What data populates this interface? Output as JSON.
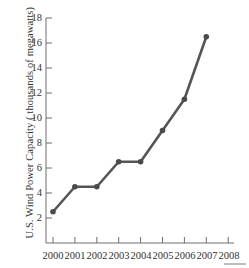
{
  "chart_data": {
    "type": "line",
    "title": "",
    "xlabel": "",
    "ylabel": "U.S. Wind Power Capacity ( thousands of megawatts)",
    "x": [
      2000,
      2001,
      2002,
      2003,
      2004,
      2005,
      2006,
      2007
    ],
    "values": [
      2.5,
      4.5,
      4.5,
      6.5,
      6.5,
      9.0,
      11.5,
      16.5
    ],
    "xtick_labels": [
      "2000",
      "2001",
      "2002",
      "2003",
      "2004",
      "2005",
      "2006",
      "2007",
      "2008"
    ],
    "ytick_labels": [
      "2",
      "4",
      "6",
      "8",
      "10",
      "12",
      "14",
      "16",
      "18"
    ],
    "xlim": [
      2000,
      2008
    ],
    "ylim": [
      0,
      18
    ],
    "grid": false,
    "legend": "none",
    "marker": "circle",
    "line_color": "#555555",
    "marker_color": "#4a4a4a",
    "axis_color": "#6e6e6e",
    "background": "#ffffff"
  }
}
